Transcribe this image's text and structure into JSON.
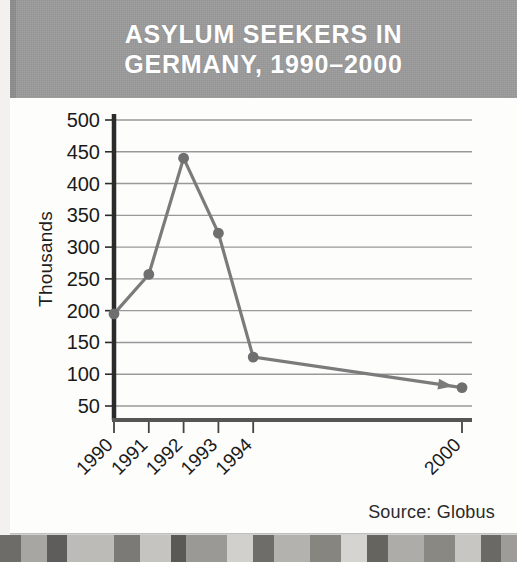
{
  "header": {
    "title_line1": "ASYLUM SEEKERS IN",
    "title_line2": "GERMANY, 1990–2000",
    "background_color": "#9a9a9a",
    "text_color": "#ffffff"
  },
  "footer": {
    "source_note": "Source: Globus"
  },
  "axis": {
    "y_title": "Thousands"
  },
  "chart_data": {
    "type": "line",
    "title": "ASYLUM SEEKERS IN GERMANY, 1990–2000",
    "xlabel": "",
    "ylabel": "Thousands",
    "categories": [
      "1990",
      "1991",
      "1992",
      "1993",
      "1994",
      "2000"
    ],
    "x_positions": [
      1990,
      1991,
      1992,
      1993,
      1994,
      2000
    ],
    "values": [
      195,
      257,
      440,
      322,
      127,
      79
    ],
    "series": [
      {
        "name": "Asylum seekers (thousands)",
        "values": [
          195,
          257,
          440,
          322,
          127,
          79
        ]
      }
    ],
    "ylim": [
      0,
      500
    ],
    "xlim": [
      1990,
      2000
    ],
    "y_ticks": [
      50,
      100,
      150,
      200,
      250,
      300,
      350,
      400,
      450,
      500
    ],
    "y_tick_labels": [
      "50",
      "100",
      "150",
      "200",
      "250",
      "300",
      "350",
      "400",
      "450",
      "500"
    ],
    "x_ticks": [
      1990,
      1991,
      1992,
      1993,
      1994,
      2000
    ],
    "x_tick_labels": [
      "1990",
      "1991",
      "1992",
      "1993",
      "1994",
      "2000"
    ],
    "x_tick_label_rotation": 45,
    "grid": "horizontal",
    "legend": "none",
    "line_color": "#7b7b7b",
    "marker_color": "#6f6f6f",
    "marker": "circle",
    "annotations": [
      {
        "type": "arrowhead",
        "note": "arrow pointing to the 2000 data point"
      }
    ],
    "axis_color": "#2b2b2b",
    "gridline_color": "#999999"
  }
}
